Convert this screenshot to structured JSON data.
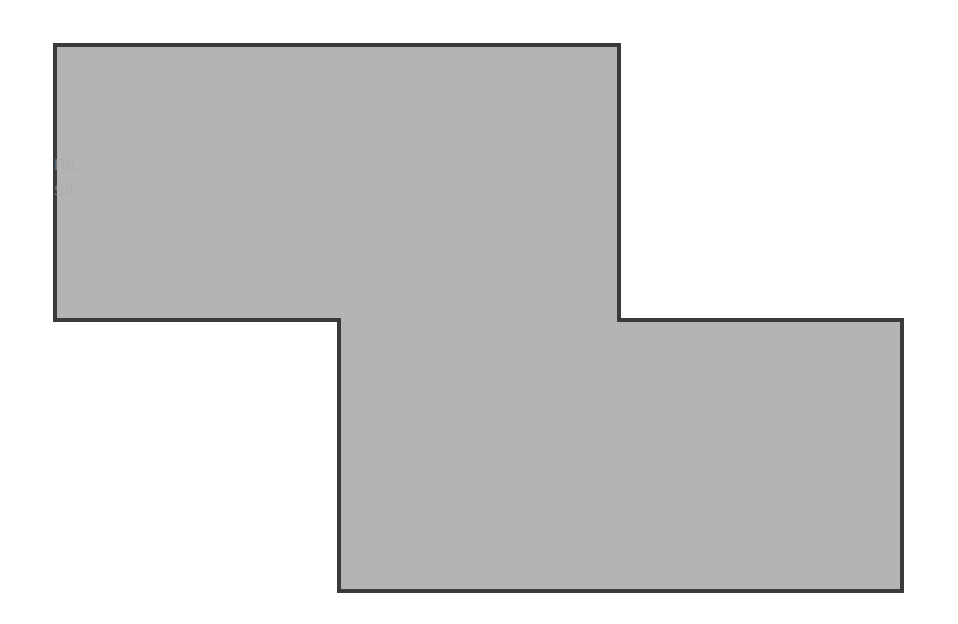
{
  "diagram": {
    "shape": "z-polygon",
    "points": [
      [
        55,
        45
      ],
      [
        619,
        45
      ],
      [
        619,
        320
      ],
      [
        902,
        320
      ],
      [
        902,
        591
      ],
      [
        339,
        591
      ],
      [
        339,
        320
      ],
      [
        55,
        320
      ]
    ],
    "fill": "#b4b4b4",
    "stroke": "#3a3a3a",
    "stroke_width": 4
  },
  "ghost_text": {
    "line1": "na",
    "line2": "sit"
  }
}
